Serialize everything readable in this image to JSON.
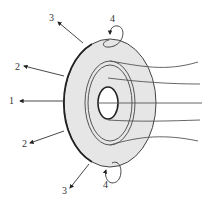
{
  "diagram": {
    "type": "ring-field-diagram",
    "colors": {
      "background": "#ffffff",
      "ring_fill": "#e6e6e6",
      "stroke": "#444444",
      "outline_dark": "#222222",
      "label": "#333333"
    },
    "labels": [
      {
        "id": "label-1",
        "text": "1",
        "x": 9,
        "y": 104
      },
      {
        "id": "label-2-top",
        "text": "2",
        "x": 15,
        "y": 70
      },
      {
        "id": "label-2-bottom",
        "text": "2",
        "x": 22,
        "y": 147
      },
      {
        "id": "label-3-top",
        "text": "3",
        "x": 49,
        "y": 21
      },
      {
        "id": "label-3-bottom",
        "text": "3",
        "x": 62,
        "y": 194
      },
      {
        "id": "label-4-top",
        "text": "4",
        "x": 110,
        "y": 22
      },
      {
        "id": "label-4-bottom",
        "text": "4",
        "x": 103,
        "y": 188
      }
    ]
  }
}
